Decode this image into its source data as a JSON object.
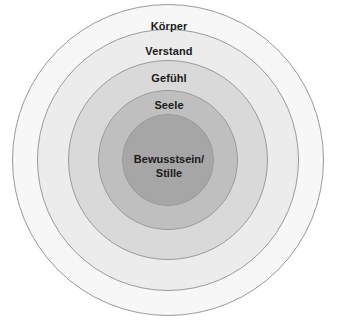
{
  "diagram": {
    "type": "concentric-circles",
    "title": "",
    "background_color": "#ffffff",
    "stroke_color": "#9a9a9a",
    "text_color": "#1a1a1a",
    "center": {
      "x": 168,
      "y": 160
    },
    "layers": [
      {
        "id": "koerper",
        "label": "Körper",
        "level": 1,
        "radius": 156,
        "fill": "#f7f7f7",
        "label_y": 20
      },
      {
        "id": "verstand",
        "label": "Verstand",
        "level": 2,
        "radius": 131,
        "fill": "#ececec",
        "label_y": 45
      },
      {
        "id": "gefuehl",
        "label": "Gefühl",
        "level": 3,
        "radius": 100,
        "fill": "#d9d9d9",
        "label_y": 72
      },
      {
        "id": "seele",
        "label": "Seele",
        "level": 4,
        "radius": 70,
        "fill": "#bfbfbf",
        "label_y": 99
      },
      {
        "id": "bewusstsein-stille",
        "label": "Bewusstsein/\nStille",
        "level": 5,
        "radius": 46,
        "fill": "#a6a6a6",
        "label_y": 152
      }
    ]
  }
}
